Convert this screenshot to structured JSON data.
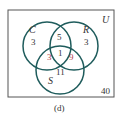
{
  "diagram": {
    "type": "venn-3",
    "universe_label": "U",
    "sets": [
      {
        "label": "C",
        "only": "3"
      },
      {
        "label": "R",
        "only": "3"
      },
      {
        "label": "S",
        "only": "11"
      }
    ],
    "regions": {
      "C_R_only": "5",
      "C_S_only": "3",
      "R_S_only": "9",
      "C_R_S": "1",
      "outside": "40"
    },
    "caption": "(d)",
    "colors": {
      "circle_stroke": "#1f5c5c",
      "box_stroke": "#555555",
      "highlight_numbers": "#b0404a"
    }
  }
}
